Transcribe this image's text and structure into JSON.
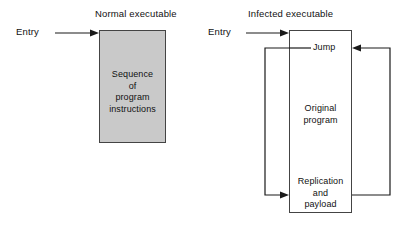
{
  "figure": {
    "kind": "virus-infection-diagram",
    "background_color": "#ffffff",
    "block_fill_color": "#c9c9c9",
    "line_color": "#1a1a1a"
  },
  "normal": {
    "title": "Normal executable",
    "entry_label": "Entry",
    "block_text": "Sequence\nof\nprogram\ninstructions",
    "entry_arrow_name": "entry-arrow-normal"
  },
  "infected": {
    "title": "Infected executable",
    "entry_label": "Entry",
    "segments": {
      "jump": "Jump",
      "original": "Original\nprogram",
      "replication": "Replication\nand\npayload"
    },
    "entry_arrow_name": "entry-arrow-infected",
    "jump_leader_name": "jump-leader-line",
    "left_loop_name": "jump-to-replication-arrow",
    "right_loop_name": "replication-to-jump-arrow"
  }
}
